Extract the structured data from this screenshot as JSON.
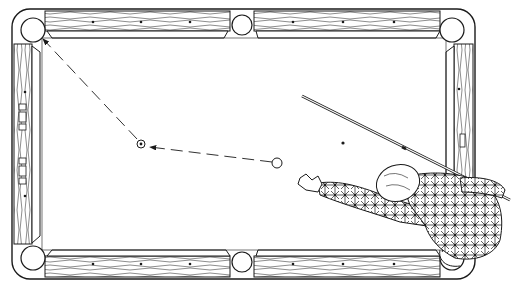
{
  "diagram": {
    "colors": {
      "ink": "#1a1a1a",
      "paper": "#ffffff"
    },
    "table": {
      "outer": {
        "x": 12,
        "y": 9,
        "w": 463,
        "h": 270,
        "r": 18
      },
      "bed": {
        "x": 42,
        "y": 38,
        "w": 405,
        "h": 212
      },
      "pockets": [
        {
          "id": "top-left",
          "cx": 33,
          "cy": 30,
          "r": 12
        },
        {
          "id": "top-middle",
          "cx": 242,
          "cy": 25,
          "r": 10
        },
        {
          "id": "top-right",
          "cx": 452,
          "cy": 30,
          "r": 12
        },
        {
          "id": "bottom-left",
          "cx": 33,
          "cy": 258,
          "r": 12
        },
        {
          "id": "bottom-middle",
          "cx": 242,
          "cy": 262,
          "r": 10
        },
        {
          "id": "bottom-right",
          "cx": 452,
          "cy": 258,
          "r": 12
        }
      ],
      "diamonds": [
        [
          93,
          22
        ],
        [
          141,
          22
        ],
        [
          190,
          22
        ],
        [
          293,
          22
        ],
        [
          343,
          22
        ],
        [
          394,
          22
        ],
        [
          93,
          264
        ],
        [
          141,
          264
        ],
        [
          190,
          264
        ],
        [
          293,
          264
        ],
        [
          343,
          264
        ],
        [
          394,
          264
        ],
        [
          25,
          92
        ],
        [
          25,
          144
        ],
        [
          25,
          196
        ],
        [
          459,
          89
        ]
      ]
    },
    "balls": [
      {
        "id": "object-ball",
        "cx": 141,
        "cy": 144,
        "r": 4,
        "marked": true
      },
      {
        "id": "cue-ball",
        "cx": 277,
        "cy": 163,
        "r": 5,
        "marked": false
      }
    ],
    "spot": {
      "cx": 343,
      "cy": 143,
      "r": 1.6
    },
    "shot_path": [
      {
        "from": [
          272,
          162
        ],
        "to": [
          150,
          147
        ],
        "arrow": true
      },
      {
        "from": [
          137,
          139
        ],
        "to": [
          42,
          38
        ],
        "arrow": true
      }
    ],
    "cue_stick": {
      "from": [
        302,
        96
      ],
      "to": [
        510,
        200
      ]
    },
    "player": {
      "description": "player leaning over table bridging hand, patterned shirt"
    }
  }
}
